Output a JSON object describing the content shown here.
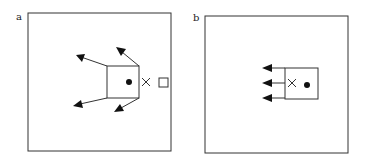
{
  "figure": {
    "stroke_color": "#333333",
    "panels": [
      {
        "id": "a",
        "label": "a",
        "description": "Square with four diagonal outward arrows from corners, dot inside, cross and small square to the right"
      },
      {
        "id": "b",
        "label": "b",
        "description": "Square with three horizontal leftward arrows from left edge, cross and dot inside"
      }
    ]
  }
}
